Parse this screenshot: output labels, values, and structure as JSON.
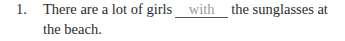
{
  "exercise": {
    "number": "1.",
    "text_before": "There are a lot of girls",
    "answer": "with",
    "text_after": "the sunglasses at",
    "text_line2": "the beach."
  }
}
